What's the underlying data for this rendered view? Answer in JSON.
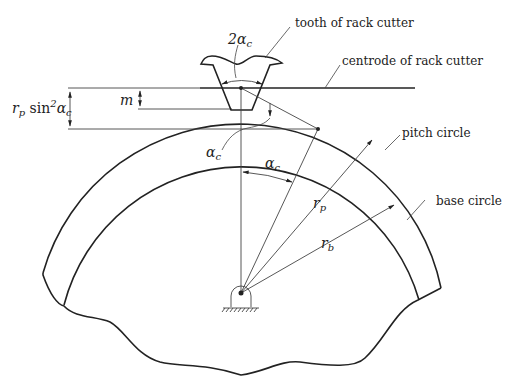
{
  "diagram": {
    "labels": {
      "tooth": "tooth of rack cutter",
      "centrode": "centrode of rack cutter",
      "pitch_circle": "pitch circle",
      "base_circle": "base circle"
    },
    "symbols": {
      "two_alpha_c": "2α",
      "two_alpha_c_sub": "c",
      "alpha_c_left": "α",
      "alpha_c_left_sub": "c",
      "alpha_c_angle": "α",
      "alpha_c_angle_sub": "c",
      "m": "m",
      "rp_sin2": "r",
      "rp_sub": "p",
      "sin": " sin",
      "sin_sup": "2",
      "alpha_after_sin": "α",
      "alpha_after_sin_sub": "c",
      "r_p": "r",
      "r_p_sub": "p",
      "r_b": "r",
      "r_b_sub": "b"
    },
    "colors": {
      "stroke": "#222222",
      "background": "#ffffff"
    }
  }
}
